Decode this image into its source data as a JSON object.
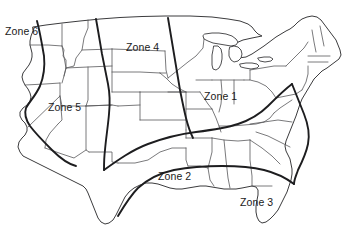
{
  "map": {
    "title": "United States Zone Map",
    "region": "Contiguous United States",
    "background_color": "#ffffff",
    "state_border_color": "#58585a",
    "coast_outline_color": "#3b3b3d",
    "zone_boundary_color": "#1d1d1f",
    "label_color": "#1a1a1a"
  },
  "zones": [
    {
      "id": "zone-1",
      "label": "Zone 1",
      "x": 204,
      "y": 91,
      "region": "Midwest / Mid-Atlantic"
    },
    {
      "id": "zone-2",
      "label": "Zone 2",
      "x": 158,
      "y": 171,
      "region": "South Central"
    },
    {
      "id": "zone-3",
      "label": "Zone 3",
      "x": 240,
      "y": 197,
      "region": "Gulf Coast / Southeast"
    },
    {
      "id": "zone-4",
      "label": "Zone 4",
      "x": 126,
      "y": 42,
      "region": "Northern Plains"
    },
    {
      "id": "zone-5",
      "label": "Zone 5",
      "x": 48,
      "y": 102,
      "region": "Interior West"
    },
    {
      "id": "zone-6",
      "label": "Zone 6",
      "x": 5,
      "y": 26,
      "region": "Pacific Coast"
    }
  ]
}
